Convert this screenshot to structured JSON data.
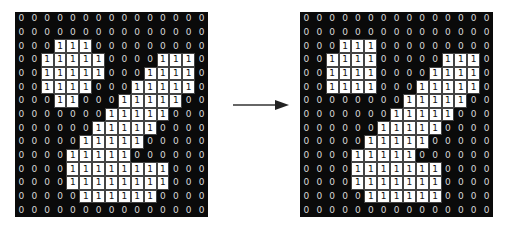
{
  "diagram": {
    "grid_size": {
      "rows": 15,
      "cols": 15
    },
    "colors": {
      "background_zero": "#0a0a0a",
      "one_cell": "#ffffff",
      "zero_text": "#d8d8d8",
      "one_text": "#111111"
    },
    "left_grid": [
      [
        0,
        0,
        0,
        0,
        0,
        0,
        0,
        0,
        0,
        0,
        0,
        0,
        0,
        0,
        0
      ],
      [
        0,
        0,
        0,
        0,
        0,
        0,
        0,
        0,
        0,
        0,
        0,
        0,
        0,
        0,
        0
      ],
      [
        0,
        0,
        0,
        1,
        1,
        1,
        0,
        0,
        0,
        0,
        0,
        0,
        0,
        0,
        0
      ],
      [
        0,
        0,
        1,
        1,
        1,
        1,
        1,
        0,
        0,
        0,
        0,
        1,
        1,
        1,
        0
      ],
      [
        0,
        0,
        1,
        1,
        1,
        1,
        1,
        0,
        0,
        0,
        1,
        1,
        1,
        1,
        0
      ],
      [
        0,
        0,
        1,
        1,
        1,
        1,
        0,
        0,
        0,
        1,
        1,
        1,
        1,
        1,
        0
      ],
      [
        0,
        0,
        0,
        1,
        1,
        0,
        0,
        0,
        1,
        1,
        1,
        1,
        1,
        0,
        0
      ],
      [
        0,
        0,
        0,
        0,
        0,
        0,
        0,
        1,
        1,
        1,
        1,
        1,
        0,
        0,
        0
      ],
      [
        0,
        0,
        0,
        0,
        0,
        0,
        1,
        1,
        1,
        1,
        1,
        0,
        0,
        0,
        0
      ],
      [
        0,
        0,
        0,
        0,
        0,
        1,
        1,
        1,
        1,
        1,
        0,
        0,
        0,
        0,
        0
      ],
      [
        0,
        0,
        0,
        0,
        1,
        1,
        1,
        1,
        1,
        0,
        0,
        0,
        0,
        0,
        0
      ],
      [
        0,
        0,
        0,
        0,
        1,
        1,
        1,
        1,
        1,
        1,
        1,
        1,
        0,
        0,
        0
      ],
      [
        0,
        0,
        0,
        0,
        1,
        1,
        1,
        1,
        1,
        1,
        1,
        1,
        0,
        0,
        0
      ],
      [
        0,
        0,
        0,
        0,
        0,
        1,
        1,
        1,
        1,
        1,
        1,
        0,
        0,
        0,
        0
      ],
      [
        0,
        0,
        0,
        0,
        0,
        0,
        0,
        0,
        0,
        0,
        0,
        0,
        0,
        0,
        0
      ]
    ],
    "right_grid": [
      [
        0,
        0,
        0,
        0,
        0,
        0,
        0,
        0,
        0,
        0,
        0,
        0,
        0,
        0,
        0
      ],
      [
        0,
        0,
        0,
        0,
        0,
        0,
        0,
        0,
        0,
        0,
        0,
        0,
        0,
        0,
        0
      ],
      [
        0,
        0,
        0,
        1,
        1,
        1,
        0,
        0,
        0,
        0,
        0,
        0,
        0,
        0,
        0
      ],
      [
        0,
        0,
        1,
        1,
        1,
        1,
        0,
        0,
        0,
        0,
        0,
        1,
        1,
        1,
        0
      ],
      [
        0,
        0,
        1,
        1,
        1,
        1,
        0,
        0,
        0,
        0,
        1,
        1,
        1,
        1,
        0
      ],
      [
        0,
        0,
        1,
        1,
        1,
        1,
        0,
        0,
        0,
        1,
        1,
        1,
        1,
        1,
        0
      ],
      [
        0,
        0,
        0,
        0,
        0,
        0,
        0,
        0,
        1,
        1,
        1,
        1,
        1,
        0,
        0
      ],
      [
        0,
        0,
        0,
        0,
        0,
        0,
        0,
        1,
        1,
        1,
        1,
        1,
        0,
        0,
        0
      ],
      [
        0,
        0,
        0,
        0,
        0,
        0,
        1,
        1,
        1,
        1,
        1,
        0,
        0,
        0,
        0
      ],
      [
        0,
        0,
        0,
        0,
        0,
        1,
        1,
        1,
        1,
        1,
        0,
        0,
        0,
        0,
        0
      ],
      [
        0,
        0,
        0,
        0,
        1,
        1,
        1,
        1,
        1,
        0,
        0,
        0,
        0,
        0,
        0
      ],
      [
        0,
        0,
        0,
        0,
        1,
        1,
        1,
        1,
        1,
        1,
        1,
        0,
        0,
        0,
        0
      ],
      [
        0,
        0,
        0,
        0,
        1,
        1,
        1,
        1,
        1,
        1,
        1,
        0,
        0,
        0,
        0
      ],
      [
        0,
        0,
        0,
        0,
        0,
        1,
        1,
        1,
        1,
        1,
        1,
        0,
        0,
        0,
        0
      ],
      [
        0,
        0,
        0,
        0,
        0,
        0,
        0,
        0,
        0,
        0,
        0,
        0,
        0,
        0,
        0
      ]
    ],
    "arrow": {
      "direction": "right",
      "icon": "arrow-right-icon"
    }
  }
}
